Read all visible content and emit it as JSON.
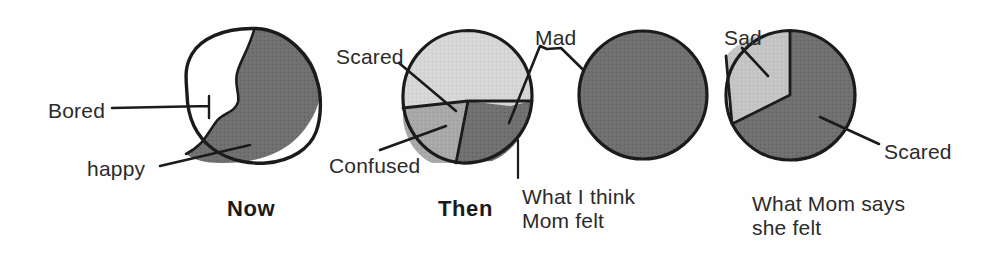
{
  "figure": {
    "background": "#fefefe",
    "ink": "#1b1b1b",
    "palette": {
      "white": "#ffffff",
      "light_gray": "#d6d6d6",
      "mid_gray": "#a8a8a8",
      "dark_gray": "#707070",
      "outline": "#1b1b1b"
    }
  },
  "labels": {
    "bored": "Bored",
    "happy": "happy",
    "now": "Now",
    "scared_then": "Scared",
    "confused": "Confused",
    "mad": "Mad",
    "then": "Then",
    "what_i_think_mom_felt": "What I think\nMom felt",
    "sad": "Sad",
    "scared_mom": "Scared",
    "what_mom_says_she_felt": "What Mom says\nshe felt"
  },
  "chart_data": [
    {
      "type": "pie",
      "title": "Now",
      "caption": "",
      "center": [
        254,
        95
      ],
      "radius": 66,
      "hand_drawn": true,
      "slices": [
        {
          "label": "Bored",
          "value": 31,
          "fill": "#ffffff",
          "start_deg": 186,
          "end_deg": 298
        },
        {
          "label": "happy",
          "value": 69,
          "fill": "#707070",
          "start_deg": 298,
          "end_deg": 546
        }
      ],
      "leader_lines": [
        {
          "label": "Bored",
          "from": [
            112,
            108
          ],
          "to": [
            210,
            106
          ]
        },
        {
          "label": "happy",
          "from": [
            163,
            165
          ],
          "to": [
            250,
            145
          ]
        }
      ]
    },
    {
      "type": "pie",
      "title": "Then",
      "caption": "",
      "center": [
        468,
        96
      ],
      "radius": 65,
      "hand_drawn": true,
      "slices": [
        {
          "label": "Scared",
          "value": 52,
          "fill": "#d6d6d6",
          "start_deg": 180,
          "end_deg": 367
        },
        {
          "label": "Mad",
          "value": 26,
          "fill": "#707070",
          "start_deg": 367,
          "end_deg": 460
        },
        {
          "label": "Confused",
          "value": 22,
          "fill": "#a8a8a8",
          "start_deg": 460,
          "end_deg": 540
        }
      ],
      "leader_lines": [
        {
          "label": "Scared",
          "from": [
            400,
            64
          ],
          "to": [
            455,
            110
          ]
        },
        {
          "label": "Confused",
          "from": [
            382,
            148
          ],
          "to": [
            443,
            127
          ]
        },
        {
          "label": "Mad",
          "from": [
            541,
            47
          ],
          "to": [
            509,
            122
          ]
        }
      ]
    },
    {
      "type": "pie",
      "title": "",
      "caption": "What I think\nMom felt",
      "center": [
        643,
        95
      ],
      "radius": 65,
      "hand_drawn": true,
      "slices": [
        {
          "label": "Mad",
          "value": 100,
          "fill": "#707070",
          "start_deg": 0,
          "end_deg": 360
        }
      ],
      "leader_lines": [
        {
          "label": "Mad",
          "from": [
            561,
            47
          ],
          "to": [
            620,
            107
          ]
        }
      ]
    },
    {
      "type": "pie",
      "title": "",
      "caption": "What Mom says\nshe felt",
      "center": [
        790,
        95
      ],
      "radius": 65,
      "hand_drawn": true,
      "slices": [
        {
          "label": "Sad",
          "value": 28,
          "fill": "#c2c2c2",
          "start_deg": 260,
          "end_deg": 360
        },
        {
          "label": "Scared",
          "value": 72,
          "fill": "#707070",
          "start_deg": 0,
          "end_deg": 260
        }
      ],
      "leader_lines": [
        {
          "label": "Sad",
          "from": [
            745,
            50
          ],
          "to": [
            765,
            75
          ]
        },
        {
          "label": "Scared",
          "from": [
            880,
            145
          ],
          "to": [
            815,
            115
          ]
        }
      ]
    }
  ]
}
